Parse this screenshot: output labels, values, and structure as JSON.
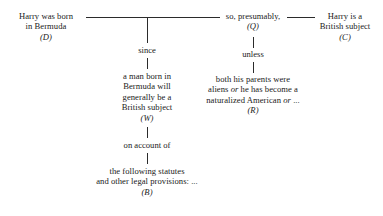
{
  "diagram": {
    "line_color": "#2b2b2b",
    "text_color": "#1a1a1a",
    "nodes": {
      "data": {
        "id": "D",
        "symbol": "(D)",
        "lines": [
          "Harry was born",
          "in Bermuda"
        ]
      },
      "qualifier": {
        "id": "Q",
        "symbol": "(Q)",
        "lines": [
          "so, presumably,"
        ]
      },
      "claim": {
        "id": "C",
        "symbol": "(C)",
        "lines": [
          "Harry is a",
          "British subject"
        ]
      },
      "warrant": {
        "id": "W",
        "symbol": "(W)",
        "lines": [
          "a man born in",
          "Bermuda will",
          "generally be a",
          "British subject"
        ]
      },
      "rebuttal": {
        "id": "R",
        "symbol": "(R)",
        "lines": [
          "both his parents were",
          "aliens or he has become a",
          "naturalized American or ..."
        ],
        "lines_rich": [
          "both his parents were",
          "aliens <em class=\"it\">or</em> he has become a",
          "naturalized American <em class=\"it\">or</em> ..."
        ]
      },
      "backing": {
        "id": "B",
        "symbol": "(B)",
        "lines": [
          "the following statutes",
          "and other legal provisions: ..."
        ]
      }
    },
    "connector_labels": {
      "since": "since",
      "unless": "unless",
      "on_account_of": "on account of"
    }
  }
}
